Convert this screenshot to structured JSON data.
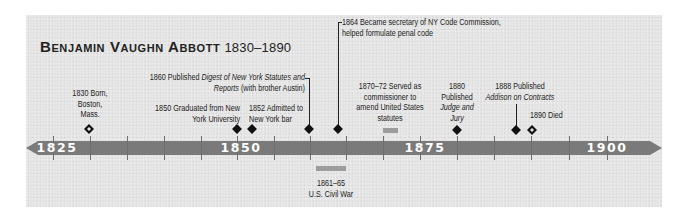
{
  "title": {
    "name": "Benjamin Vaughn Abbott",
    "years": "1830–1890"
  },
  "axis": {
    "start": 1825,
    "end": 1900,
    "major_labels": [
      "1825",
      "1850",
      "1875",
      "1900"
    ],
    "tick_interval_years": 5,
    "bar_color": "#7a7a7a"
  },
  "events": [
    {
      "year": "1830",
      "lines": [
        "1830 Born,",
        "Boston,",
        "Mass."
      ],
      "marker": "open-diamond"
    },
    {
      "year": "1850",
      "lines": [
        "1850 Graduated from New",
        "York University"
      ],
      "marker": "diamond"
    },
    {
      "year": "1852",
      "lines": [
        "1852 Admitted to",
        "New York bar"
      ],
      "marker": "diamond"
    },
    {
      "year": "1860",
      "line1_prefix": "1860 Published ",
      "line1_italic": "Digest of New York Statutes and",
      "line2_italic": "Reports",
      "line2_suffix": " (with brother Austin)",
      "marker": "diamond"
    },
    {
      "year": "1864",
      "lines": [
        "1864 Became secretary of NY Code Commission,",
        "helped formulate penal code"
      ],
      "marker": "diamond"
    },
    {
      "year": "1870–72",
      "lines": [
        "1870–72 Served as",
        "commissioner to",
        "amend United States",
        "statutes"
      ],
      "marker": "range"
    },
    {
      "year": "1880",
      "line1": "1880",
      "line2": "Published",
      "line3_italic": "Judge and",
      "line4_italic": "Jury",
      "marker": "diamond"
    },
    {
      "year": "1888",
      "line1": "1888 Published",
      "line2_italic": "Addison on Contracts",
      "marker": "diamond"
    },
    {
      "year": "1890",
      "lines": [
        "1890 Died"
      ],
      "marker": "open-diamond"
    }
  ],
  "context_events": [
    {
      "year": "1861–65",
      "lines": [
        "1861–65",
        "U.S. Civil War"
      ],
      "marker": "range"
    }
  ]
}
